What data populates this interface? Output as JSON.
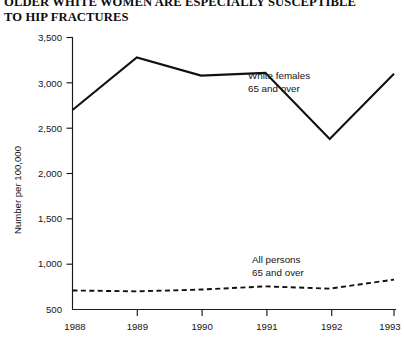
{
  "title": {
    "line1": "OLDER WHITE WOMEN ARE ESPECIALLY SUSCEPTIBLE",
    "line2": "TO HIP FRACTURES"
  },
  "chart_data": {
    "type": "line",
    "title": "OLDER WHITE WOMEN ARE ESPECIALLY SUSCEPTIBLE TO HIP FRACTURES",
    "xlabel": "",
    "ylabel": "Number per 100,000",
    "categories": [
      "1988",
      "1989",
      "1990",
      "1991",
      "1992",
      "1993"
    ],
    "x": [
      1988,
      1989,
      1990,
      1991,
      1992,
      1993
    ],
    "xlim": [
      1988,
      1993
    ],
    "ylim": [
      500,
      3500
    ],
    "yticks": [
      500,
      1000,
      1500,
      2000,
      2500,
      3000,
      3500
    ],
    "ytick_labels": [
      "500",
      "1,000",
      "1,500",
      "2,000",
      "2,500",
      "3,000",
      "3,500"
    ],
    "xtick_labels": [
      "1988",
      "1989",
      "1990",
      "1991",
      "1992",
      "1993"
    ],
    "grid": false,
    "legend_position": "inline-annotation",
    "series": [
      {
        "name": "White females 65 and over",
        "style": "solid",
        "color": "#111111",
        "label_line1": "White females",
        "label_line2": "65 and over",
        "values": [
          2700,
          3280,
          3080,
          3110,
          2380,
          3100
        ]
      },
      {
        "name": "All persons 65 and over",
        "style": "dashed",
        "color": "#111111",
        "label_line1": "All persons",
        "label_line2": "65 and over",
        "values": [
          710,
          700,
          720,
          755,
          730,
          830
        ]
      }
    ]
  }
}
